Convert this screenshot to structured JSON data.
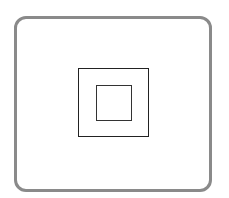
{
  "diagram": {
    "frame": {
      "shape": "rounded-rectangle",
      "stroke_color": "#8a8a8a"
    },
    "shapes": [
      {
        "name": "outer-square",
        "stroke_color": "#222222"
      },
      {
        "name": "inner-square",
        "stroke_color": "#333333"
      }
    ]
  }
}
